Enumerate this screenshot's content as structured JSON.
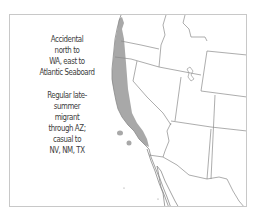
{
  "map": {
    "title": "",
    "range_color": "#a8a8a8",
    "border_color": "#8a8a8a",
    "frame_color": "#c8c8c8",
    "regions_shown": [
      "Washington",
      "Oregon",
      "California",
      "Idaho",
      "Nevada",
      "Utah",
      "Wyoming",
      "Arizona",
      "Colorado",
      "New Mexico",
      "Baja California",
      "Sonora"
    ]
  },
  "notes": [
    {
      "lines": [
        "Accidental",
        "north to",
        "WA, east to",
        "Atlantic Seaboard"
      ]
    },
    {
      "lines": [
        "Regular late-",
        "summer",
        "migrant",
        "through AZ;",
        "casual to",
        "NV, NM, TX"
      ]
    }
  ]
}
